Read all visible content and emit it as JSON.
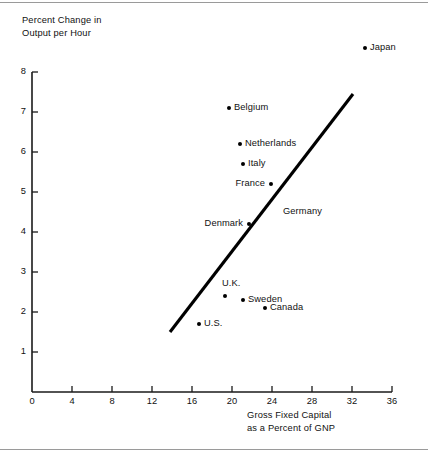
{
  "chart_data": {
    "type": "scatter",
    "title": "",
    "xlabel": "Gross Fixed Capital\nas a Percent of GNP",
    "ylabel": "Percent Change in\nOutput per Hour",
    "xlim": [
      0,
      36
    ],
    "ylim": [
      0,
      8
    ],
    "xticks": [
      0,
      4,
      8,
      12,
      16,
      20,
      24,
      28,
      32,
      36
    ],
    "yticks": [
      0,
      1,
      2,
      3,
      4,
      5,
      6,
      7,
      8
    ],
    "grid": false,
    "legend": "none",
    "points": [
      {
        "label": "Japan",
        "x": 33.3,
        "y": 8.6,
        "label_side": "right"
      },
      {
        "label": "Belgium",
        "x": 19.7,
        "y": 7.1,
        "label_side": "right"
      },
      {
        "label": "Netherlands",
        "x": 20.8,
        "y": 6.2,
        "label_side": "right"
      },
      {
        "label": "Italy",
        "x": 21.1,
        "y": 5.7,
        "label_side": "right"
      },
      {
        "label": "France",
        "x": 23.9,
        "y": 5.2,
        "label_side": "left"
      },
      {
        "label": "Germany",
        "x": 24.6,
        "y": 4.5,
        "label_side": "right",
        "marker": false
      },
      {
        "label": "Denmark",
        "x": 21.7,
        "y": 4.2,
        "label_side": "left"
      },
      {
        "label": "U.K.",
        "x": 19.3,
        "y": 2.4,
        "label_side": "above"
      },
      {
        "label": "Sweden",
        "x": 21.1,
        "y": 2.3,
        "label_side": "right"
      },
      {
        "label": "Canada",
        "x": 23.3,
        "y": 2.1,
        "label_side": "right"
      },
      {
        "label": "U.S.",
        "x": 16.7,
        "y": 1.7,
        "label_side": "right"
      }
    ],
    "trend_line": {
      "x0": 13.8,
      "y0": 1.5,
      "x1": 32.1,
      "y1": 7.45
    },
    "colors": {
      "ink": "#000000",
      "axis": "#1a1a1a",
      "rule": "#9a9a9a",
      "background": "#ffffff"
    }
  }
}
